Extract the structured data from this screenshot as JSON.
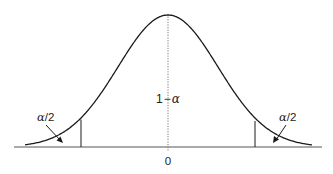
{
  "diagram": {
    "type": "normal-distribution-two-tailed",
    "center_label": "1−α",
    "center_label_parts": {
      "one": "1",
      "minus": "−",
      "alpha": "α"
    },
    "left_tail_label": "α/2",
    "left_tail_parts": {
      "alpha": "α",
      "slash_two": "/2"
    },
    "right_tail_label": "α/2",
    "right_tail_parts": {
      "alpha": "α",
      "slash_two": "/2"
    },
    "axis_tick_label": "0",
    "colors": {
      "curve": "#1a1a1a",
      "axis": "#555555",
      "center_line": "#777777",
      "text": "#222222"
    }
  }
}
